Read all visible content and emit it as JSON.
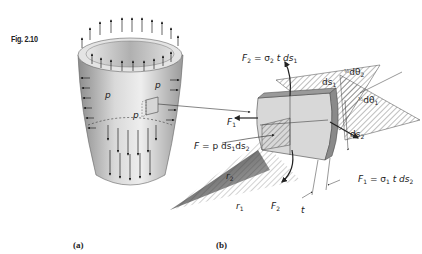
{
  "figure": {
    "number_label": "Fig. 2.10",
    "panel_a_label": "(a)",
    "panel_b_label": "(b)"
  },
  "panel_a": {
    "description": "Thin-walled shell of revolution under internal pressure",
    "pressure_labels": [
      "p",
      "p",
      "p"
    ],
    "colors": {
      "shell_light": "#e6e6e6",
      "shell_dark": "#8a8a8a",
      "arrow": "#222222"
    }
  },
  "panel_b": {
    "description": "Stress element cut from the shell",
    "labels": {
      "F2_top": "F",
      "F2_top_sub": "2",
      "F2_top_eq": " = σ",
      "F2_top_eq_sub": "2",
      "F2_top_rest": "t ds",
      "F2_top_rest_sub": "1",
      "F1_left": "F",
      "F1_left_sub": "1",
      "F_pressure": "F",
      "F_pressure_eq": " = p ds",
      "F_pressure_sub1": "1",
      "F_pressure_ds2": "ds",
      "F_pressure_sub2": "2",
      "ds1": "ds",
      "ds1_sub": "1",
      "ds2": "ds",
      "ds2_sub": "2",
      "half_dtheta2": "dθ",
      "half_dtheta2_sub": "2",
      "half_dtheta1": "dθ",
      "half_dtheta1_sub": "1",
      "half": "½",
      "F1_right": "F",
      "F1_right_sub": "1",
      "F1_right_eq": " = σ",
      "F1_right_eq_sub": "1",
      "F1_right_rest": "t ds",
      "F1_right_rest_sub": "2",
      "F2_bottom": "F",
      "F2_bottom_sub": "2",
      "r2": "r",
      "r2_sub": "2",
      "r1": "r",
      "r1_sub": "1",
      "t": "t"
    },
    "colors": {
      "element_face": "#d4d4d4",
      "element_edge": "#9a9a9a",
      "hatch": "#444444"
    }
  }
}
